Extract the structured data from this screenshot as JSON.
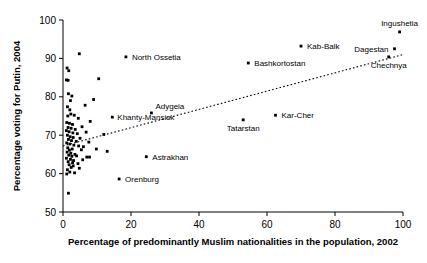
{
  "chart_data": {
    "type": "scatter",
    "title": "",
    "xlabel": "Percentage of predominantly Muslim nationalities in the population, 2002",
    "ylabel": "Percentage voting for Putin, 2004",
    "xlim": [
      0,
      100
    ],
    "ylim": [
      50,
      100
    ],
    "xticks": [
      0,
      20,
      40,
      60,
      80,
      100
    ],
    "yticks": [
      50,
      60,
      70,
      80,
      90,
      100
    ],
    "grid": false,
    "legend": "none",
    "trendline": {
      "label": "fitted dotted regression line",
      "style": "dotted",
      "x0": 0,
      "y0": 67.2,
      "x1": 100,
      "y1": 91.0
    },
    "labeled_points": [
      {
        "label": "North Ossetia",
        "x": 18.5,
        "y": 90.4
      },
      {
        "label": "Kab-Balk",
        "x": 70.0,
        "y": 93.2
      },
      {
        "label": "Bashkortostan",
        "x": 54.5,
        "y": 88.8
      },
      {
        "label": "Ingushetia",
        "x": 99.0,
        "y": 96.9
      },
      {
        "label": "Dagestan",
        "x": 97.5,
        "y": 92.5
      },
      {
        "label": "Chechnya",
        "x": 95.8,
        "y": 90.4
      },
      {
        "label": "Kar-Cher",
        "x": 62.5,
        "y": 75.2
      },
      {
        "label": "Tatarstan",
        "x": 53.0,
        "y": 74.0
      },
      {
        "label": "Adygeia",
        "x": 26.0,
        "y": 75.8
      },
      {
        "label": "Khanty-Mansisk",
        "x": 14.5,
        "y": 74.7
      },
      {
        "label": "Astrakhan",
        "x": 24.5,
        "y": 64.4
      },
      {
        "label": "Orenburg",
        "x": 16.5,
        "y": 58.6
      }
    ],
    "unlabeled_points": [
      {
        "x": 4.8,
        "y": 91.2
      },
      {
        "x": 1.2,
        "y": 87.5
      },
      {
        "x": 1.7,
        "y": 86.8
      },
      {
        "x": 1.0,
        "y": 84.4
      },
      {
        "x": 1.5,
        "y": 84.3
      },
      {
        "x": 10.5,
        "y": 84.7
      },
      {
        "x": 1.6,
        "y": 80.8
      },
      {
        "x": 2.6,
        "y": 80.2
      },
      {
        "x": 2.2,
        "y": 79.0
      },
      {
        "x": 9.0,
        "y": 79.3
      },
      {
        "x": 1.3,
        "y": 77.4
      },
      {
        "x": 2.0,
        "y": 76.6
      },
      {
        "x": 6.5,
        "y": 77.8
      },
      {
        "x": 2.3,
        "y": 75.5
      },
      {
        "x": 1.4,
        "y": 75.0
      },
      {
        "x": 3.3,
        "y": 75.2
      },
      {
        "x": 4.5,
        "y": 74.4
      },
      {
        "x": 8.0,
        "y": 73.6
      },
      {
        "x": 1.1,
        "y": 73.3
      },
      {
        "x": 1.9,
        "y": 73.1
      },
      {
        "x": 2.8,
        "y": 72.8
      },
      {
        "x": 5.6,
        "y": 72.2
      },
      {
        "x": 1.5,
        "y": 72.0
      },
      {
        "x": 2.4,
        "y": 71.8
      },
      {
        "x": 3.6,
        "y": 71.5
      },
      {
        "x": 1.0,
        "y": 71.2
      },
      {
        "x": 1.8,
        "y": 70.9
      },
      {
        "x": 2.9,
        "y": 70.6
      },
      {
        "x": 4.2,
        "y": 70.4
      },
      {
        "x": 6.8,
        "y": 70.8
      },
      {
        "x": 12.0,
        "y": 70.2
      },
      {
        "x": 1.3,
        "y": 70.0
      },
      {
        "x": 2.1,
        "y": 69.6
      },
      {
        "x": 3.0,
        "y": 69.4
      },
      {
        "x": 5.0,
        "y": 69.2
      },
      {
        "x": 1.6,
        "y": 68.9
      },
      {
        "x": 2.5,
        "y": 68.6
      },
      {
        "x": 3.9,
        "y": 68.4
      },
      {
        "x": 7.6,
        "y": 68.2
      },
      {
        "x": 1.1,
        "y": 68.0
      },
      {
        "x": 2.0,
        "y": 67.7
      },
      {
        "x": 3.2,
        "y": 67.4
      },
      {
        "x": 4.6,
        "y": 67.2
      },
      {
        "x": 6.0,
        "y": 67.0
      },
      {
        "x": 1.4,
        "y": 66.7
      },
      {
        "x": 2.7,
        "y": 66.4
      },
      {
        "x": 1.9,
        "y": 66.1
      },
      {
        "x": 5.4,
        "y": 66.2
      },
      {
        "x": 9.8,
        "y": 66.4
      },
      {
        "x": 13.0,
        "y": 65.8
      },
      {
        "x": 1.2,
        "y": 65.6
      },
      {
        "x": 2.3,
        "y": 65.3
      },
      {
        "x": 3.5,
        "y": 65.0
      },
      {
        "x": 1.7,
        "y": 64.8
      },
      {
        "x": 2.6,
        "y": 64.5
      },
      {
        "x": 4.0,
        "y": 64.6
      },
      {
        "x": 7.0,
        "y": 64.3
      },
      {
        "x": 7.8,
        "y": 64.3
      },
      {
        "x": 1.0,
        "y": 64.0
      },
      {
        "x": 2.2,
        "y": 63.7
      },
      {
        "x": 3.1,
        "y": 63.4
      },
      {
        "x": 5.8,
        "y": 63.6
      },
      {
        "x": 1.5,
        "y": 63.1
      },
      {
        "x": 2.8,
        "y": 62.8
      },
      {
        "x": 4.4,
        "y": 62.6
      },
      {
        "x": 1.8,
        "y": 62.3
      },
      {
        "x": 3.0,
        "y": 62.0
      },
      {
        "x": 2.4,
        "y": 61.6
      },
      {
        "x": 4.8,
        "y": 61.4
      },
      {
        "x": 1.3,
        "y": 61.0
      },
      {
        "x": 2.0,
        "y": 60.4
      },
      {
        "x": 3.4,
        "y": 60.2
      },
      {
        "x": 1.1,
        "y": 59.9
      },
      {
        "x": 1.6,
        "y": 54.9
      }
    ]
  }
}
